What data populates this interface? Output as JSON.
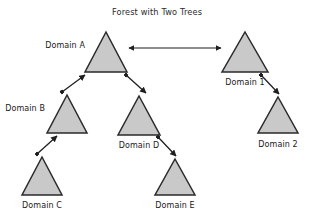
{
  "diagram": {
    "title": "Forest with Two Trees",
    "type": "tree-forest-diagram",
    "background_color": "#ffffff",
    "node_fill_color": "#c9c9c9",
    "node_stroke_color": "#2a2a2a",
    "edge_color": "#1f1f1f",
    "nodes": [
      {
        "id": "a",
        "label": "Domain A",
        "tree": "tree-1",
        "level": 0,
        "apex_x": 106,
        "apex_y": 32,
        "base_y": 72,
        "half_width": 21,
        "label_x": 85,
        "label_y": 48,
        "label_anchor": "end"
      },
      {
        "id": "b",
        "label": "Domain B",
        "tree": "tree-1",
        "level": 1,
        "apex_x": 67,
        "apex_y": 95,
        "base_y": 133,
        "half_width": 20,
        "label_x": 45,
        "label_y": 111,
        "label_anchor": "end"
      },
      {
        "id": "d",
        "label": "Domain D",
        "tree": "tree-1",
        "level": 1,
        "apex_x": 139,
        "apex_y": 96,
        "base_y": 135,
        "half_width": 21,
        "label_x": 139,
        "label_y": 148,
        "label_anchor": "middle"
      },
      {
        "id": "c",
        "label": "Domain C",
        "tree": "tree-1",
        "level": 2,
        "apex_x": 42,
        "apex_y": 157,
        "base_y": 195,
        "half_width": 20,
        "label_x": 42,
        "label_y": 208,
        "label_anchor": "middle"
      },
      {
        "id": "e",
        "label": "Domain E",
        "tree": "tree-1",
        "level": 2,
        "apex_x": 175,
        "apex_y": 159,
        "base_y": 195,
        "half_width": 20,
        "label_x": 175,
        "label_y": 208,
        "label_anchor": "middle"
      },
      {
        "id": "one",
        "label": "Domain 1",
        "tree": "tree-2",
        "level": 0,
        "apex_x": 245,
        "apex_y": 32,
        "base_y": 72,
        "half_width": 23,
        "label_x": 245,
        "label_y": 85,
        "label_anchor": "middle"
      },
      {
        "id": "two",
        "label": "Domain 2",
        "tree": "tree-2",
        "level": 1,
        "apex_x": 278,
        "apex_y": 97,
        "base_y": 133,
        "half_width": 20,
        "label_x": 278,
        "label_y": 147,
        "label_anchor": "middle"
      }
    ],
    "edges": [
      {
        "id": "b-to-a",
        "from": "b",
        "to": "a",
        "arrowheads": "single",
        "x1": 62,
        "y1": 92,
        "x2": 85,
        "y2": 75
      },
      {
        "id": "a-to-d",
        "from": "a",
        "to": "d",
        "arrowheads": "single",
        "x1": 126,
        "y1": 75,
        "x2": 146,
        "y2": 93
      },
      {
        "id": "c-to-b",
        "from": "c",
        "to": "b",
        "arrowheads": "single",
        "x1": 37,
        "y1": 154,
        "x2": 57,
        "y2": 136
      },
      {
        "id": "d-to-e",
        "from": "d",
        "to": "e",
        "arrowheads": "single",
        "x1": 158,
        "y1": 137,
        "x2": 176,
        "y2": 156
      },
      {
        "id": "one-to-two",
        "from": "one",
        "to": "two",
        "arrowheads": "single",
        "x1": 261,
        "y1": 75,
        "x2": 279,
        "y2": 94
      },
      {
        "id": "a-to-one-peer",
        "from": "a",
        "to": "one",
        "arrowheads": "double",
        "x1": 129,
        "y1": 48,
        "x2": 221,
        "y2": 48
      }
    ],
    "title_x": 157,
    "title_y": 15
  }
}
